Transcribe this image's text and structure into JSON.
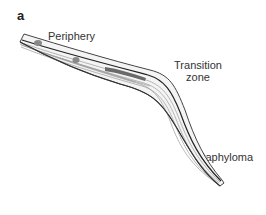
{
  "figure": {
    "panel_letter": "a",
    "labels": {
      "periphery": "Periphery",
      "transition_line1": "Transition",
      "transition_line2": "zone",
      "staphyloma": "Staphyloma"
    },
    "colors": {
      "outline": "#333333",
      "fiber": "#9a9a9a",
      "inner_band": "#c8c8c8",
      "cell_body": "#777777"
    }
  }
}
